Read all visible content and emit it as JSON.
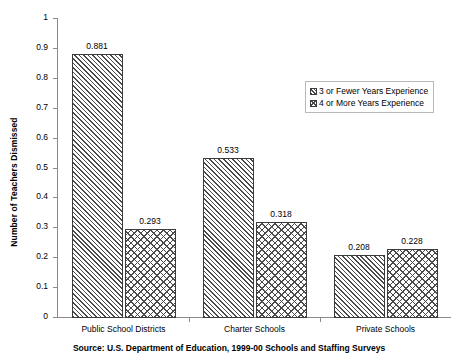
{
  "chart_data": {
    "type": "bar",
    "title": "",
    "xlabel": "",
    "ylabel": "Number of Teachers Dismissed",
    "ylim": [
      0,
      1
    ],
    "ytick_labels": [
      "1",
      "0.9",
      "0.8",
      "0.7",
      "0.6",
      "0.5",
      "0.4",
      "0.3",
      "0.2",
      "0.1",
      "0"
    ],
    "ytick_values": [
      1,
      0.9,
      0.8,
      0.7,
      0.6,
      0.5,
      0.4,
      0.3,
      0.2,
      0.1,
      0
    ],
    "grid": false,
    "legend_position": "upper-right-inside",
    "categories": [
      "Public School Districts",
      "Charter Schools",
      "Private Schools"
    ],
    "series": [
      {
        "name": "3 or Fewer Years Experience",
        "pattern": "diagonal-hatch",
        "values": [
          0.881,
          0.533,
          0.208
        ],
        "labels": [
          "0.881",
          "0.533",
          "0.208"
        ]
      },
      {
        "name": "4 or More Years Experience",
        "pattern": "cross-hatch",
        "values": [
          0.293,
          0.318,
          0.228
        ],
        "labels": [
          "0.293",
          "0.318",
          "0.228"
        ]
      }
    ],
    "source_note": "Source: U.S. Department of Education, 1999-00 Schools and Staffing Surveys",
    "colors": {
      "axis": "#8a8a8a",
      "bar_border": "#3b3b3b",
      "hatch": "#4a4a4a",
      "background": "#ffffff",
      "text": "#000000",
      "legend_border": "#b9b9b9"
    }
  }
}
